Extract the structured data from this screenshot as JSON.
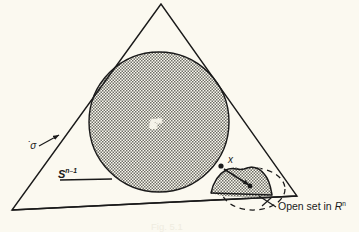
{
  "figure": {
    "background_color": "#fbf9f0",
    "ink_color": "#1a1a1a",
    "hatch_color": "#6e6e66",
    "caption": "Fig. 5.1"
  },
  "labels": {
    "sigma": {
      "text": "σ",
      "accent": "˙",
      "description": "sigma with overdot, interior of simplex, leader arrow to left edge"
    },
    "sphere": {
      "base": "S",
      "exponent": "n–1",
      "full": "S n–1",
      "description": "boundary sphere label with leader line to circle"
    },
    "disc": {
      "base": "E",
      "exponent": "n",
      "full": "E n",
      "description": "inscribed closed disc label, white knockout over hatching"
    },
    "point_x": {
      "text": "x",
      "description": "marked point on the circle boundary"
    },
    "open_set": {
      "text": "Open set in ",
      "symbol_base": "R",
      "symbol_exponent": "n",
      "full": "Open set in R n",
      "description": "callout for the hatched blob straddling the base line"
    }
  },
  "geometry": {
    "triangle": {
      "apex": [
        161,
        4
      ],
      "bottom_left": [
        12,
        210
      ],
      "bottom_right": [
        297,
        196
      ],
      "stroke_width": 1.3
    },
    "inscribed_circle": {
      "center": [
        159,
        122
      ],
      "radius": 70,
      "fill": "hatched",
      "stroke_width": 1.4
    },
    "point_x": [
      221,
      166
    ],
    "open_set_blob": {
      "fill": "hatched",
      "description": "irregular closed region near bottom right, partly above and below the base edge"
    },
    "dashed_ellipse": {
      "center": [
        253,
        189
      ],
      "rx": 32,
      "ry": 21,
      "style": "dashed"
    },
    "leaders": [
      {
        "name": "sigma-leader",
        "from": [
          40,
          145
        ],
        "to": [
          58,
          134
        ]
      },
      {
        "name": "sphere-leader",
        "from": [
          88,
          176
        ],
        "to": [
          113,
          176
        ]
      },
      {
        "name": "x-to-blob-arrow",
        "from": [
          224,
          168
        ],
        "to": [
          248,
          184
        ]
      },
      {
        "name": "openset-leader",
        "from": [
          275,
          206
        ],
        "to": [
          258,
          198
        ]
      }
    ]
  }
}
